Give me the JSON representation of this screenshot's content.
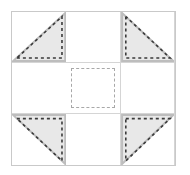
{
  "diagram": {
    "type": "quilt-block",
    "grid": {
      "rows": 3,
      "columns": 3
    },
    "colors": {
      "background": "#ffffff",
      "patch_fill": "#e8e8e8",
      "patch_edge": "#bdbdbd",
      "seam_line": "#d5d5d5",
      "outer_border": "#c9c9c9",
      "stitch_dash": "#3a3a3a",
      "center_dash": "#a8a8a8"
    },
    "cells": [
      {
        "position": "top-left",
        "row": 0,
        "col": 0,
        "kind": "half-square-triangle",
        "right_angle_corner": "bottom-right",
        "fill": "#e8e8e8",
        "has_stitch_line": true
      },
      {
        "position": "top-center",
        "row": 0,
        "col": 1,
        "kind": "plain-square",
        "fill": "#ffffff",
        "has_stitch_line": false
      },
      {
        "position": "top-right",
        "row": 0,
        "col": 2,
        "kind": "half-square-triangle",
        "right_angle_corner": "bottom-left",
        "fill": "#e8e8e8",
        "has_stitch_line": true
      },
      {
        "position": "middle-left",
        "row": 1,
        "col": 0,
        "kind": "plain-square",
        "fill": "#ffffff",
        "has_stitch_line": false
      },
      {
        "position": "center",
        "row": 1,
        "col": 1,
        "kind": "dashed-square",
        "fill": "#ffffff",
        "has_stitch_line": true
      },
      {
        "position": "middle-right",
        "row": 1,
        "col": 2,
        "kind": "plain-square",
        "fill": "#ffffff",
        "has_stitch_line": false
      },
      {
        "position": "bottom-left",
        "row": 2,
        "col": 0,
        "kind": "half-square-triangle",
        "right_angle_corner": "top-right",
        "fill": "#e8e8e8",
        "has_stitch_line": true
      },
      {
        "position": "bottom-center",
        "row": 2,
        "col": 1,
        "kind": "plain-square",
        "fill": "#ffffff",
        "has_stitch_line": false
      },
      {
        "position": "bottom-right",
        "row": 2,
        "col": 2,
        "kind": "half-square-triangle",
        "right_angle_corner": "top-left",
        "fill": "#e8e8e8",
        "has_stitch_line": true
      }
    ]
  }
}
